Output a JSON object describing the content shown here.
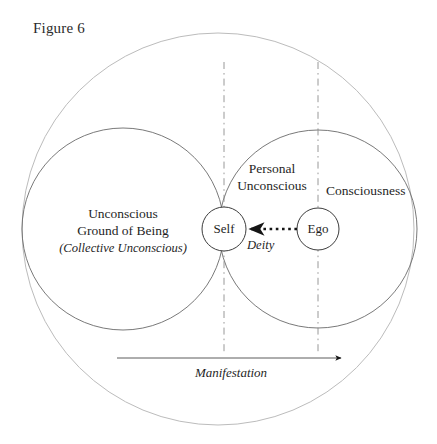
{
  "figure": {
    "title": "Figure 6",
    "type": "diagram",
    "background_color": "#ffffff",
    "ink_color": "#1f1f1f",
    "outer_circle_color": "#b9b9b9",
    "inner_circle_color": "#5d5d5d",
    "node_circle_color": "#3f3f3f",
    "arrow_color": "#1a1a1a"
  },
  "labels": {
    "unconscious_ground": {
      "line1": "Unconscious",
      "line2": "Ground of Being",
      "line3": "(Collective Unconscious)"
    },
    "personal_unconscious": "Personal\nUnconscious",
    "personal_unconscious_line1": "Personal",
    "personal_unconscious_line2": "Unconscious",
    "consciousness": "Consciousness",
    "deity": "Deity",
    "manifestation": "Manifestation"
  },
  "nodes": {
    "self": "Self",
    "ego": "Ego"
  },
  "geometry": {
    "outer_circle": {
      "cx": 218,
      "cy": 229,
      "r": 196
    },
    "left_circle": {
      "cx": 123,
      "cy": 229,
      "r": 101
    },
    "right_circle": {
      "cx": 318,
      "cy": 229,
      "r": 99
    },
    "self_circle": {
      "cx": 224,
      "cy": 229,
      "r": 22
    },
    "ego_circle": {
      "cx": 318,
      "cy": 229,
      "r": 21
    },
    "dashed_line_left_x": 224,
    "dashed_line_right_x": 318,
    "dashed_line_top_y": 62,
    "dashed_line_bottom_y": 353,
    "manifestation_arrow": {
      "x1": 117,
      "x2": 347,
      "y": 358
    },
    "deity_arrow": {
      "x1": 297,
      "x2": 246,
      "y": 229
    }
  }
}
